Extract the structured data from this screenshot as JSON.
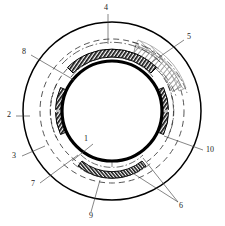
{
  "figure": {
    "type": "patent-line-drawing",
    "background_color": "#ffffff",
    "line_color": "#000000",
    "center": {
      "x": 112,
      "y": 111
    },
    "circles": [
      {
        "name": "outer-boundary-circle",
        "radius": 89,
        "style": "solid",
        "width": 1.4
      },
      {
        "name": "outer-dashed-circle",
        "radius": 72,
        "style": "dashed",
        "width": 0.8
      },
      {
        "name": "inner-dashed-circle",
        "radius": 57,
        "style": "dashed",
        "width": 0.8
      },
      {
        "name": "inner-thick-circle",
        "radius": 50,
        "style": "solid",
        "width": 3.2
      }
    ],
    "segments": [
      {
        "name": "segment-top-outer",
        "position": "top",
        "radius": 66,
        "start_deg": 238,
        "end_deg": 302,
        "fill": "hatched-dark"
      },
      {
        "name": "segment-top-inner",
        "position": "top",
        "radius": 56,
        "start_deg": 242,
        "end_deg": 298,
        "fill": "hatched-dark"
      },
      {
        "name": "segment-left",
        "position": "left",
        "radius": 57,
        "start_deg": 155,
        "end_deg": 205,
        "fill": "hatched-dark"
      },
      {
        "name": "segment-right",
        "position": "right",
        "radius": 57,
        "start_deg": -25,
        "end_deg": 25,
        "fill": "hatched-dark"
      },
      {
        "name": "segment-bottom",
        "position": "bottom",
        "radius": 57,
        "start_deg": 62,
        "end_deg": 118,
        "fill": "hatched-dark"
      },
      {
        "name": "region-upper-right-hatched",
        "position": "upper-right",
        "radius": 72,
        "start_deg": 288,
        "end_deg": 338,
        "fill": "cross-hatch-light"
      }
    ]
  },
  "labels": [
    {
      "id": "1",
      "text": "1",
      "x": 85,
      "y": 141,
      "leader_from": [
        93,
        145
      ],
      "leader_to": [
        73,
        160
      ]
    },
    {
      "id": "2",
      "text": "2",
      "x": 8,
      "y": 114,
      "leader_from": [
        16,
        118
      ],
      "leader_to": [
        28,
        118
      ]
    },
    {
      "id": "3",
      "text": "3",
      "x": 13,
      "y": 158,
      "leader_from": [
        21,
        160
      ],
      "leader_to": [
        41,
        150
      ]
    },
    {
      "id": "4",
      "text": "4",
      "x": 104,
      "y": 9,
      "leader_from": [
        107,
        14
      ],
      "leader_to": [
        107,
        42
      ]
    },
    {
      "id": "5",
      "text": "5",
      "x": 186,
      "y": 37,
      "leader_from": [
        185,
        41
      ],
      "leader_to": [
        156,
        60
      ]
    },
    {
      "id": "6",
      "text": "6",
      "x": 179,
      "y": 206,
      "leader_from": [
        180,
        203
      ],
      "leader_to": [
        144,
        159
      ]
    },
    {
      "id": "7",
      "text": "7",
      "x": 31,
      "y": 186,
      "leader_from": [
        39,
        185
      ],
      "leader_to": [
        75,
        157
      ]
    },
    {
      "id": "8",
      "text": "8",
      "x": 22,
      "y": 53,
      "leader_from": [
        30,
        56
      ],
      "leader_to": [
        72,
        79
      ]
    },
    {
      "id": "9",
      "text": "9",
      "x": 89,
      "y": 218,
      "leader_from": [
        91,
        213
      ],
      "leader_to": [
        99,
        181
      ]
    },
    {
      "id": "10",
      "text": "10",
      "x": 207,
      "y": 152,
      "leader_from": [
        206,
        150
      ],
      "leader_to": [
        166,
        137
      ]
    }
  ]
}
